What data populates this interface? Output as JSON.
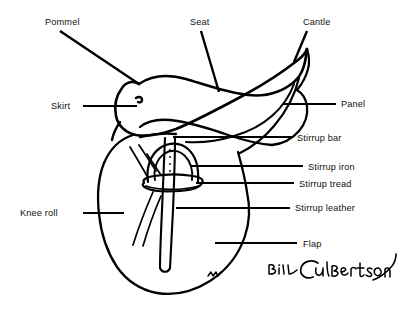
{
  "figure": {
    "style": "hand-drawn line art, black ink on white",
    "width": 412,
    "height": 320,
    "background_color": "#ffffff",
    "ink_color": "#000000"
  },
  "labels": [
    {
      "id": "pommel",
      "text": "Pommel",
      "text_x": 45,
      "text_y": 25,
      "anchor": "start",
      "leader": "M 60 31 L 139 84",
      "leader_width": 2.4,
      "side": "top-left"
    },
    {
      "id": "seat",
      "text": "Seat",
      "text_x": 190,
      "text_y": 25,
      "anchor": "start",
      "leader": "M 201 31 L 219 92",
      "leader_width": 2.4,
      "side": "top-center"
    },
    {
      "id": "cantle",
      "text": "Cantle",
      "text_x": 303,
      "text_y": 25,
      "anchor": "start",
      "leader": "M 307 31 L 294 62",
      "leader_width": 2.4,
      "side": "top-right"
    },
    {
      "id": "skirt",
      "text": "Skirt",
      "text_x": 51,
      "text_y": 109,
      "anchor": "start",
      "leader": "M 83 106 L 137 106",
      "leader_width": 2.2,
      "side": "left"
    },
    {
      "id": "panel",
      "text": "Panel",
      "text_x": 341,
      "text_y": 107,
      "anchor": "start",
      "leader": "M 283 104 L 336 104",
      "leader_width": 2.2,
      "side": "right"
    },
    {
      "id": "stirrup-bar",
      "text": "Stirrup bar",
      "text_x": 297,
      "text_y": 141,
      "anchor": "start",
      "leader": "M 173 137 L 292 137",
      "leader_width": 2.2,
      "side": "right"
    },
    {
      "id": "stirrup-iron",
      "text": "Stirrup iron",
      "text_x": 308,
      "text_y": 170,
      "anchor": "start",
      "leader": "M 190 166 L 303 166",
      "leader_width": 2.2,
      "side": "right"
    },
    {
      "id": "stirrup-tread",
      "text": "Stirrup tread",
      "text_x": 299,
      "text_y": 187,
      "anchor": "start",
      "leader": "M 196 183 L 294 183",
      "leader_width": 2.2,
      "side": "right"
    },
    {
      "id": "stirrup-leather",
      "text": "Stirrup leather",
      "text_x": 295,
      "text_y": 211,
      "anchor": "start",
      "leader": "M 176 208 L 290 208",
      "leader_width": 2.2,
      "side": "right"
    },
    {
      "id": "knee-roll",
      "text": "Knee roll",
      "text_x": 20,
      "text_y": 216,
      "anchor": "start",
      "leader": "M 83 213 L 124 213",
      "leader_width": 2.2,
      "side": "left"
    },
    {
      "id": "flap",
      "text": "Flap",
      "text_x": 303,
      "text_y": 247,
      "anchor": "start",
      "leader": "M 215 243 L 297 243",
      "leader_width": 2.2,
      "side": "right"
    }
  ],
  "signature": {
    "id": "signature",
    "text": "BILL CULBERTSON",
    "x": 268,
    "y": 272,
    "style": "handwritten script"
  },
  "drawing_parts": [
    {
      "id": "pommel-seat",
      "name": "pommel and seat outline"
    },
    {
      "id": "cantle",
      "name": "cantle upsweep"
    },
    {
      "id": "panel",
      "name": "panel"
    },
    {
      "id": "flap",
      "name": "saddle flap"
    },
    {
      "id": "knee-roll",
      "name": "knee roll crease lines"
    },
    {
      "id": "stirrup-iron",
      "name": "stirrup iron arch"
    },
    {
      "id": "stirrup-tread",
      "name": "stirrup tread"
    },
    {
      "id": "stirrup-leather",
      "name": "stirrup leather strap"
    },
    {
      "id": "stirrup-bar",
      "name": "stirrup bar"
    },
    {
      "id": "skirt-hook",
      "name": "skirt hook mark"
    }
  ]
}
